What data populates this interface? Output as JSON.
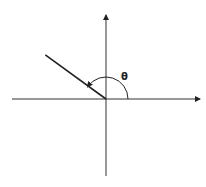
{
  "diagram": {
    "angle_label": "θ",
    "angle_degrees": 144,
    "axes": [
      "x-axis",
      "y-axis"
    ],
    "colors": {
      "line": "#222222",
      "axis": "#333333",
      "background": "#ffffff"
    }
  }
}
